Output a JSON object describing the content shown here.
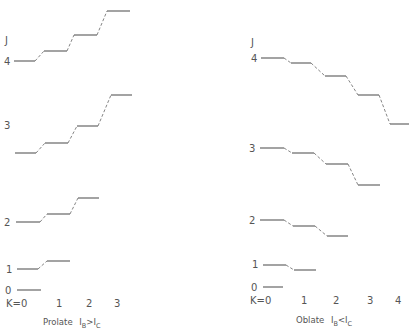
{
  "panels": [
    {
      "id": "prolate",
      "caption_prefix": "Prolate",
      "caption_formula": "IB>IC",
      "caption_parts": {
        "i1": "I",
        "s1": "B",
        "rel": ">",
        "i2": "I",
        "s2": "C"
      },
      "axis_label": "J",
      "k_labels": [
        "K=0",
        "1",
        "2",
        "3"
      ],
      "j_labels": [
        "4",
        "3",
        "2",
        "1",
        "0"
      ],
      "levels": {
        "J4": [
          61,
          51,
          35,
          11
        ],
        "J3": [
          125,
          115,
          99,
          95
        ],
        "J2": [
          222,
          214,
          198
        ],
        "J1": [
          269,
          261
        ],
        "J0": [
          290
        ]
      }
    },
    {
      "id": "oblate",
      "caption_prefix": "Oblate",
      "caption_formula": "IB<IC",
      "caption_parts": {
        "i1": "I",
        "s1": "B",
        "rel": "<",
        "i2": "I",
        "s2": "C"
      },
      "axis_label": "J",
      "k_labels": [
        "K=0",
        "1",
        "2",
        "3",
        "4"
      ],
      "j_labels": [
        "4",
        "3",
        "2",
        "1",
        "0"
      ],
      "levels": {
        "J4": [
          58,
          63,
          76,
          95,
          124
        ],
        "J3": [
          148,
          153,
          164,
          185
        ],
        "J2": [
          220,
          226,
          236
        ],
        "J1": [
          265,
          270
        ],
        "J0": [
          287
        ]
      }
    }
  ]
}
